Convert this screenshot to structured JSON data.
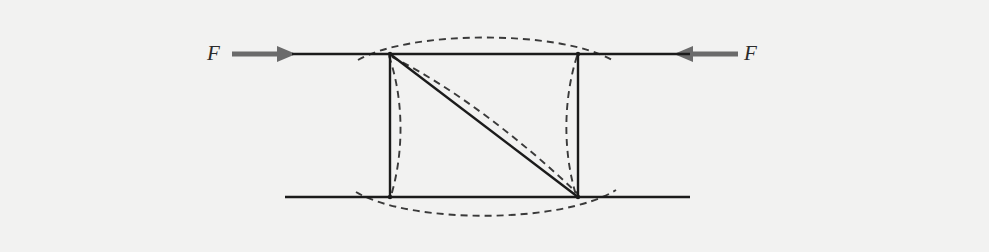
{
  "figure": {
    "background_color": "#f2f2f1",
    "width": 989,
    "height": 252
  },
  "labels": {
    "force_left": "F",
    "force_right": "F"
  },
  "colors": {
    "solid_line": "#1b1b1b",
    "dashed_line": "#3a3a3a",
    "arrow": "#6b6b6b",
    "text": "#2b2b2b"
  },
  "geometry": {
    "frame": {
      "top_left": {
        "x": 390,
        "y": 54
      },
      "top_right": {
        "x": 578,
        "y": 54
      },
      "bottom_left": {
        "x": 390,
        "y": 197
      },
      "bottom_right": {
        "x": 578,
        "y": 197
      }
    },
    "top_member": {
      "x1": 292,
      "y1": 54,
      "x2": 690,
      "y2": 54
    },
    "bottom_member": {
      "x1": 285,
      "y1": 197,
      "x2": 690,
      "y2": 197
    },
    "diagonal_brace": {
      "x1": 390,
      "y1": 54,
      "x2": 578,
      "y2": 197
    }
  },
  "arrows": {
    "left": {
      "name": "force-arrow-left",
      "direction": "right",
      "tail_x": 232,
      "tip_x": 296,
      "y": 54
    },
    "right": {
      "name": "force-arrow-right",
      "direction": "left",
      "tail_x": 738,
      "tip_x": 674,
      "y": 54
    }
  },
  "deformed_shape": {
    "style": "dashed",
    "dash_pattern": "7,5",
    "description": "Buckled configuration of the frame members",
    "members": [
      {
        "name": "deformed-top-member",
        "bulge": "up",
        "peak_offset_px": 16
      },
      {
        "name": "deformed-bottom-member",
        "bulge": "down",
        "peak_offset_px": 15
      },
      {
        "name": "deformed-left-column",
        "bulge": "right",
        "peak_offset_px": 13
      },
      {
        "name": "deformed-right-column",
        "bulge": "left",
        "peak_offset_px": 13
      },
      {
        "name": "deformed-diagonal",
        "bulge": "upper-right",
        "peak_offset_px": 9
      }
    ]
  }
}
